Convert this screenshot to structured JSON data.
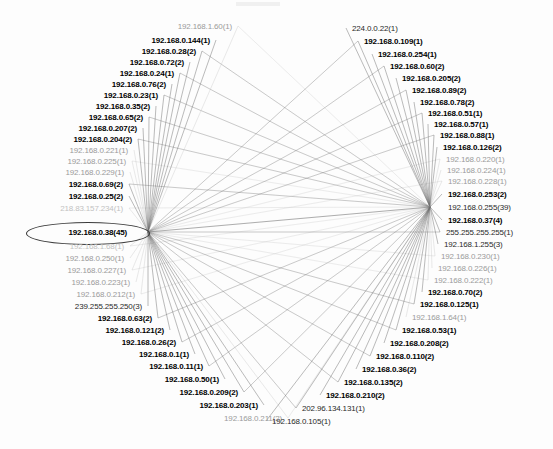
{
  "graph": {
    "title": "Network traffic host connection graph",
    "hubs": [
      {
        "id": "left-hub",
        "x": 148,
        "y": 232,
        "label": "192.168.0.38(45)"
      },
      {
        "id": "right-hub",
        "x": 430,
        "y": 207,
        "label": "192.168.0.255(39)"
      }
    ],
    "highlight": {
      "target_label": "192.168.0.38(45)",
      "shape": "ellipse",
      "x": 26,
      "y": 222,
      "width": 122,
      "height": 21,
      "color": "#3a3a3a"
    },
    "colors": {
      "edge": "#6e6e6e",
      "edge_faint": "#b9b9b9",
      "text_strong": "#000000",
      "text_normal": "#2a2a2a",
      "text_faded": "#9b9b9b",
      "text_ghost": "#c2c2c2",
      "background": "#fdfdfd",
      "highlight": "#3a3a3a"
    },
    "left_nodes": [
      {
        "label": "192.168.1.60(1)",
        "x": 232,
        "y": 26,
        "weight": "faded"
      },
      {
        "label": "192.168.0.144(1)",
        "x": 210,
        "y": 40,
        "weight": "strong"
      },
      {
        "label": "192.168.0.28(2)",
        "x": 196,
        "y": 51,
        "weight": "strong"
      },
      {
        "label": "192.168.0.72(2)",
        "x": 184,
        "y": 62,
        "weight": "strong"
      },
      {
        "label": "192.168.0.24(1)",
        "x": 174,
        "y": 73,
        "weight": "strong"
      },
      {
        "label": "192.168.0.76(2)",
        "x": 166,
        "y": 84,
        "weight": "strong"
      },
      {
        "label": "192.168.0.23(1)",
        "x": 158,
        "y": 95,
        "weight": "strong"
      },
      {
        "label": "192.168.0.35(2)",
        "x": 150,
        "y": 106,
        "weight": "strong"
      },
      {
        "label": "192.168.0.65(2)",
        "x": 143,
        "y": 117,
        "weight": "strong"
      },
      {
        "label": "192.168.0.207(2)",
        "x": 137,
        "y": 128,
        "weight": "strong"
      },
      {
        "label": "192.168.0.204(2)",
        "x": 132,
        "y": 139,
        "weight": "strong"
      },
      {
        "label": "192.168.0.221(1)",
        "x": 128,
        "y": 150,
        "weight": "faded"
      },
      {
        "label": "192.168.0.225(1)",
        "x": 126,
        "y": 161,
        "weight": "faded"
      },
      {
        "label": "192.168.0.229(1)",
        "x": 124,
        "y": 172,
        "weight": "faded"
      },
      {
        "label": "192.168.0.69(2)",
        "x": 123,
        "y": 184,
        "weight": "strong"
      },
      {
        "label": "192.168.0.25(2)",
        "x": 123,
        "y": 196,
        "weight": "strong"
      },
      {
        "label": "218.83.157.234(1)",
        "x": 123,
        "y": 208,
        "weight": "ghost"
      },
      {
        "label": "192.168.0.38(45)",
        "x": 127,
        "y": 232,
        "weight": "strong"
      },
      {
        "label": "192.168.1.68(1)",
        "x": 124,
        "y": 246,
        "weight": "ghost"
      },
      {
        "label": "192.168.0.250(1)",
        "x": 124,
        "y": 258,
        "weight": "faded"
      },
      {
        "label": "192.168.0.227(1)",
        "x": 126,
        "y": 270,
        "weight": "faded"
      },
      {
        "label": "192.168.0.223(1)",
        "x": 130,
        "y": 282,
        "weight": "faded"
      },
      {
        "label": "192.168.0.212(1)",
        "x": 135,
        "y": 294,
        "weight": "faded"
      },
      {
        "label": "239.255.255.250(3)",
        "x": 142,
        "y": 306,
        "weight": "normal"
      },
      {
        "label": "192.168.0.63(2)",
        "x": 152,
        "y": 318,
        "weight": "strong"
      },
      {
        "label": "192.168.0.121(2)",
        "x": 164,
        "y": 330,
        "weight": "strong"
      },
      {
        "label": "192.168.0.26(2)",
        "x": 176,
        "y": 342,
        "weight": "strong"
      },
      {
        "label": "192.168.0.1(1)",
        "x": 189,
        "y": 354,
        "weight": "strong"
      },
      {
        "label": "192.168.0.11(1)",
        "x": 203,
        "y": 366,
        "weight": "strong"
      },
      {
        "label": "192.168.0.50(1)",
        "x": 219,
        "y": 379,
        "weight": "strong"
      },
      {
        "label": "192.168.0.209(2)",
        "x": 238,
        "y": 392,
        "weight": "strong"
      },
      {
        "label": "192.168.0.203(1)",
        "x": 258,
        "y": 405,
        "weight": "strong"
      },
      {
        "label": "192.168.0.211(2)",
        "x": 282,
        "y": 418,
        "weight": "faded"
      }
    ],
    "right_nodes": [
      {
        "label": "224.0.0.22(1)",
        "x": 352,
        "y": 28,
        "weight": "normal"
      },
      {
        "label": "192.168.0.109(1)",
        "x": 364,
        "y": 41,
        "weight": "strong"
      },
      {
        "label": "192.168.0.254(1)",
        "x": 378,
        "y": 54,
        "weight": "strong"
      },
      {
        "label": "192.168.0.60(2)",
        "x": 390,
        "y": 66,
        "weight": "strong"
      },
      {
        "label": "192.168.0.205(2)",
        "x": 402,
        "y": 78,
        "weight": "strong"
      },
      {
        "label": "192.168.0.89(2)",
        "x": 412,
        "y": 90,
        "weight": "strong"
      },
      {
        "label": "192.168.0.78(2)",
        "x": 420,
        "y": 102,
        "weight": "strong"
      },
      {
        "label": "192.168.0.51(1)",
        "x": 428,
        "y": 113,
        "weight": "strong"
      },
      {
        "label": "192.168.0.57(1)",
        "x": 434,
        "y": 124,
        "weight": "strong"
      },
      {
        "label": "192.168.0.88(1)",
        "x": 440,
        "y": 135,
        "weight": "strong"
      },
      {
        "label": "192.168.0.126(2)",
        "x": 443,
        "y": 147,
        "weight": "strong"
      },
      {
        "label": "192.168.0.220(1)",
        "x": 446,
        "y": 159,
        "weight": "faded"
      },
      {
        "label": "192.168.0.224(1)",
        "x": 447,
        "y": 170,
        "weight": "faded"
      },
      {
        "label": "192.168.0.228(1)",
        "x": 448,
        "y": 181,
        "weight": "faded"
      },
      {
        "label": "192.168.0.253(2)",
        "x": 448,
        "y": 194,
        "weight": "strong"
      },
      {
        "label": "192.168.0.255(39)",
        "x": 448,
        "y": 207,
        "weight": "normal"
      },
      {
        "label": "192.168.0.37(4)",
        "x": 448,
        "y": 220,
        "weight": "strong"
      },
      {
        "label": "255.255.255.255(1)",
        "x": 446,
        "y": 232,
        "weight": "normal"
      },
      {
        "label": "192.168.1.255(3)",
        "x": 444,
        "y": 244,
        "weight": "normal"
      },
      {
        "label": "192.168.0.230(1)",
        "x": 441,
        "y": 256,
        "weight": "faded"
      },
      {
        "label": "192.168.0.226(1)",
        "x": 438,
        "y": 268,
        "weight": "faded"
      },
      {
        "label": "192.168.0.222(1)",
        "x": 434,
        "y": 280,
        "weight": "faded"
      },
      {
        "label": "192.168.0.70(2)",
        "x": 428,
        "y": 292,
        "weight": "strong"
      },
      {
        "label": "192.168.0.125(1)",
        "x": 420,
        "y": 304,
        "weight": "strong"
      },
      {
        "label": "192.168.1.64(1)",
        "x": 412,
        "y": 317,
        "weight": "faded"
      },
      {
        "label": "192.168.0.53(1)",
        "x": 402,
        "y": 330,
        "weight": "strong"
      },
      {
        "label": "192.168.0.208(2)",
        "x": 390,
        "y": 343,
        "weight": "strong"
      },
      {
        "label": "192.168.0.110(2)",
        "x": 376,
        "y": 356,
        "weight": "strong"
      },
      {
        "label": "192.168.0.36(2)",
        "x": 362,
        "y": 369,
        "weight": "strong"
      },
      {
        "label": "192.168.0.135(2)",
        "x": 344,
        "y": 382,
        "weight": "strong"
      },
      {
        "label": "192.168.0.210(2)",
        "x": 326,
        "y": 395,
        "weight": "strong"
      },
      {
        "label": "202.96.134.131(1)",
        "x": 302,
        "y": 408,
        "weight": "normal"
      },
      {
        "label": "192.168.0.105(1)",
        "x": 272,
        "y": 421,
        "weight": "normal"
      }
    ]
  }
}
